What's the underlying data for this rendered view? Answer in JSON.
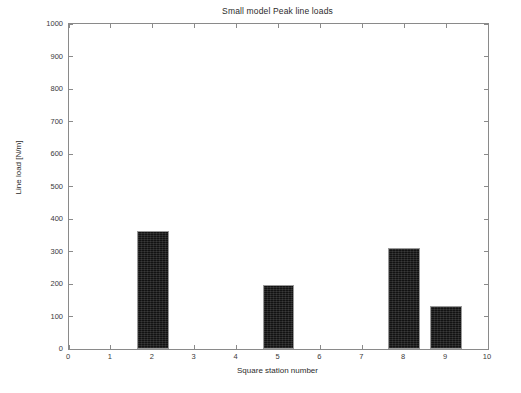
{
  "chart_data": {
    "type": "bar",
    "title": "Small model Peak line loads",
    "xlabel": "Square station number",
    "ylabel": "Line load [N/m]",
    "categories": [
      2,
      5,
      8,
      9
    ],
    "values": [
      362,
      196,
      310,
      132
    ],
    "bar_width": 0.76,
    "xlim": [
      0,
      10
    ],
    "ylim": [
      0,
      1000
    ],
    "xticks": [
      0,
      1,
      2,
      3,
      4,
      5,
      6,
      7,
      8,
      9,
      10
    ],
    "yticks": [
      0,
      100,
      200,
      300,
      400,
      500,
      600,
      700,
      800,
      900,
      1000
    ],
    "xtick_labels": [
      "0",
      "1",
      "2",
      "3",
      "4",
      "5",
      "6",
      "7",
      "8",
      "9",
      "10"
    ],
    "ytick_labels": [
      "0",
      "100",
      "200",
      "300",
      "400",
      "500",
      "600",
      "700",
      "800",
      "900",
      "1000"
    ],
    "grid": false,
    "legend": null,
    "bar_color": "#121212",
    "bar_edge_color": "#9a9a9a",
    "axes_color": "#8a8a8a",
    "background": "#ffffff"
  }
}
